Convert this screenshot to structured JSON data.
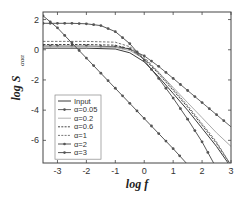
{
  "chart_data": {
    "type": "line",
    "title": "",
    "xlabel": "log f",
    "ylabel": "log S",
    "ylabel_subscript": "ααα",
    "xlim": [
      -3.5,
      3
    ],
    "ylim": [
      -7.5,
      2.5
    ],
    "xticks": [
      -3,
      -2,
      -1,
      0,
      1,
      2,
      3
    ],
    "xtick_labels": [
      "-3",
      "-2",
      "-1",
      "0",
      "1",
      "2",
      "3"
    ],
    "yticks": [
      2,
      0,
      -2,
      -4,
      -6
    ],
    "ytick_labels": [
      "2",
      "0",
      "-2",
      "-4",
      "-6"
    ],
    "grid": false,
    "legend_position": "bottom-left",
    "series": [
      {
        "name": "Input",
        "style": "solid",
        "color": "#222222",
        "marker": false,
        "x": [
          -3.5,
          -3,
          -2,
          -1,
          -0.5,
          0,
          0.5,
          1,
          1.5,
          2,
          2.5,
          2.9
        ],
        "y": [
          0.1,
          0.1,
          0.1,
          0.05,
          -0.2,
          -0.8,
          -1.8,
          -2.9,
          -4.0,
          -5.2,
          -6.4,
          -7.5
        ]
      },
      {
        "name": "α=0.05",
        "style": "solid",
        "color": "#555555",
        "marker": true,
        "x": [
          -3.5,
          -3,
          -2,
          -1,
          -0.5,
          0,
          0.5,
          1,
          1.5,
          2,
          2.5,
          3
        ],
        "y": [
          0.25,
          0.25,
          0.25,
          0.2,
          0.05,
          -0.4,
          -1.1,
          -1.9,
          -2.7,
          -3.5,
          -4.3,
          -5.1
        ]
      },
      {
        "name": "α=0.2",
        "style": "solid",
        "color": "#aaaaaa",
        "marker": false,
        "x": [
          -3.5,
          -3,
          -2,
          -1,
          -0.5,
          0,
          0.5,
          1,
          1.5,
          2,
          2.5,
          3
        ],
        "y": [
          0.2,
          0.2,
          0.2,
          0.15,
          -0.05,
          -0.6,
          -1.5,
          -2.5,
          -3.5,
          -4.5,
          -5.5,
          -6.4
        ]
      },
      {
        "name": "α=0.6",
        "style": "dashed",
        "color": "#333333",
        "marker": false,
        "x": [
          -3.5,
          -3,
          -2,
          -1,
          -0.5,
          0,
          0.5,
          1,
          1.5,
          2,
          2.5,
          2.95
        ],
        "y": [
          0.35,
          0.35,
          0.35,
          0.3,
          0.05,
          -0.6,
          -1.6,
          -2.7,
          -3.8,
          -5.0,
          -6.2,
          -7.5
        ]
      },
      {
        "name": "α=1",
        "style": "dashed",
        "color": "#666666",
        "marker": false,
        "x": [
          -3.5,
          -3,
          -2,
          -1,
          -0.5,
          0,
          0.5,
          1,
          1.5,
          2,
          2.5,
          2.95
        ],
        "y": [
          0.55,
          0.55,
          0.55,
          0.5,
          0.2,
          -0.5,
          -1.5,
          -2.6,
          -3.7,
          -4.9,
          -6.1,
          -7.5
        ]
      },
      {
        "name": "α=2",
        "style": "solid",
        "color": "#444444",
        "marker": true,
        "x": [
          -3.5,
          -3,
          -2.5,
          -2,
          -1.5,
          -1,
          -0.5,
          0,
          0.5,
          1,
          1.5,
          2,
          2.4
        ],
        "y": [
          1.75,
          1.75,
          1.75,
          1.72,
          1.6,
          1.2,
          0.4,
          -0.7,
          -1.9,
          -3.2,
          -4.6,
          -6.1,
          -7.5
        ]
      },
      {
        "name": "α=3",
        "style": "solid",
        "color": "#444444",
        "marker": true,
        "x": [
          -3.5,
          -3,
          -2.5,
          -2,
          -1.5,
          -1,
          -0.5,
          0,
          0.5,
          1,
          1.45
        ],
        "y": [
          2.25,
          1.45,
          0.45,
          -0.55,
          -1.55,
          -2.55,
          -3.55,
          -4.55,
          -5.55,
          -6.55,
          -7.5
        ]
      }
    ]
  }
}
